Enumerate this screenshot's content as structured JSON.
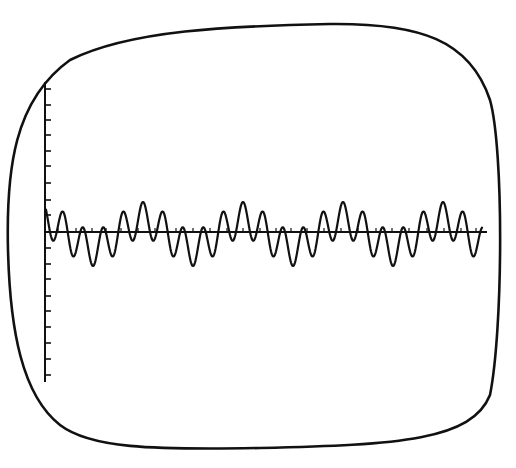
{
  "figure": {
    "title": "",
    "colors": {
      "background": "#ffffff",
      "ink": "#111111"
    }
  },
  "screen": {
    "outline": "rounded-rectangle CRT screen",
    "left": 4,
    "top": 23,
    "right": 500,
    "bottom": 451
  },
  "axes": {
    "vertical": {
      "x": 45,
      "y_top": 82,
      "y_bottom": 382,
      "tick_length": 6,
      "ticks_y": [
        89,
        105,
        120,
        135,
        151,
        166,
        183,
        200,
        215,
        248,
        264,
        279,
        296,
        311,
        327,
        343,
        359,
        375
      ]
    },
    "horizontal": {
      "y": 232,
      "x_start": 45,
      "x_end": 487,
      "tick_length": 4,
      "ticks_x": [
        58,
        76,
        92,
        106,
        121,
        138,
        155,
        176,
        193,
        210,
        227,
        243,
        260,
        276,
        291,
        307,
        324,
        341,
        358,
        376,
        392,
        409,
        427,
        444,
        461,
        476
      ]
    }
  },
  "waveform": {
    "type": "periodic sum of harmonics",
    "x_start": 46,
    "x_end": 482,
    "baseline_y": 232,
    "period_px": 100,
    "phase_peak_x": 143,
    "harmonics": [
      {
        "order": 1,
        "amplitude_px": 14
      },
      {
        "order": 5,
        "amplitude_px": 18
      }
    ],
    "offset_px": -2,
    "stroke_width": 2.2,
    "peak_positions_x": [
      43,
      143,
      243,
      343,
      443
    ]
  }
}
